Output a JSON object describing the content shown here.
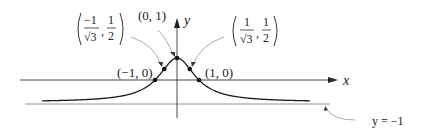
{
  "diagram": {
    "function": "y = (1 - x^2) / (1 + x^2)",
    "axes": {
      "x_label": "x",
      "y_label": "y"
    },
    "points": [
      {
        "id": "peak",
        "label": "(0, 1)",
        "x": 0,
        "y": 1
      },
      {
        "id": "x-intercept-left",
        "label": "(−1, 0)",
        "x": -1,
        "y": 0
      },
      {
        "id": "x-intercept-right",
        "label": "(1, 0)",
        "x": 1,
        "y": 0
      },
      {
        "id": "inflection-left",
        "label_num_x": "−1",
        "label_den_x": "√3",
        "label_num_y": "1",
        "label_den_y": "2",
        "x": -0.5774,
        "y": 0.5
      },
      {
        "id": "inflection-right",
        "label_num_x": "1",
        "label_den_x": "√3",
        "label_num_y": "1",
        "label_den_y": "2",
        "x": 0.5774,
        "y": 0.5
      }
    ],
    "asymptote": {
      "label": "y = −1",
      "y": -1
    },
    "colors": {
      "curve": "#1a1a1a",
      "axis": "#333333",
      "asymptote": "#666666",
      "leader": "#888888"
    }
  }
}
